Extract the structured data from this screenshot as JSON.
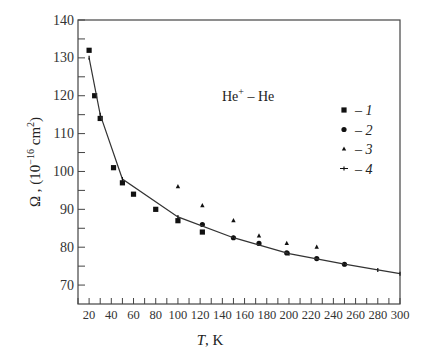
{
  "chart_data": {
    "type": "scatter",
    "title": "",
    "annotation": "He⁺ – He",
    "annotation_base": "He",
    "annotation_sup": "+",
    "annotation_rest": " – He",
    "xlabel": "T , K",
    "xlabel_var": "T",
    "xlabel_unit": ", K",
    "ylabel": "Ω , (10⁻¹⁶ cm²)",
    "ylabel_pre": "Ω , (10",
    "ylabel_exp": "−16",
    "ylabel_mid": " cm",
    "ylabel_exp2": "2",
    "ylabel_post": ")",
    "xlim": [
      10,
      300
    ],
    "ylim": [
      65,
      140
    ],
    "x_ticks": [
      20,
      40,
      60,
      80,
      100,
      120,
      140,
      160,
      180,
      200,
      220,
      240,
      260,
      280,
      300
    ],
    "x_minor_ticks": [
      10,
      30,
      50,
      70,
      90,
      110,
      130,
      150,
      170,
      190,
      210,
      230,
      250,
      270,
      290
    ],
    "y_ticks": [
      70,
      80,
      90,
      100,
      110,
      120,
      130,
      140
    ],
    "y_minor_ticks": [
      75,
      85,
      95,
      105,
      115,
      125,
      135
    ],
    "grid": false,
    "legend_position": "right-middle",
    "series": [
      {
        "name": "1",
        "marker": "square",
        "x": [
          20,
          25,
          30,
          42,
          50,
          60,
          80,
          100,
          122
        ],
        "y": [
          132,
          120,
          114,
          101,
          97,
          94,
          90,
          87,
          84
        ]
      },
      {
        "name": "2",
        "marker": "circle",
        "x": [
          122,
          150,
          173,
          198,
          225,
          250
        ],
        "y": [
          86,
          82.5,
          81,
          78.5,
          77,
          75.5
        ]
      },
      {
        "name": "3",
        "marker": "triangle",
        "x": [
          100,
          122,
          150,
          173,
          198,
          225
        ],
        "y": [
          96,
          91,
          87,
          83,
          81,
          80
        ]
      },
      {
        "name": "4",
        "marker": "line-with-tick",
        "x": [
          20,
          30,
          50,
          100,
          150,
          200,
          250,
          280,
          300
        ],
        "y": [
          130,
          115,
          98,
          88,
          82.5,
          78.3,
          75.5,
          74,
          73
        ]
      }
    ]
  }
}
